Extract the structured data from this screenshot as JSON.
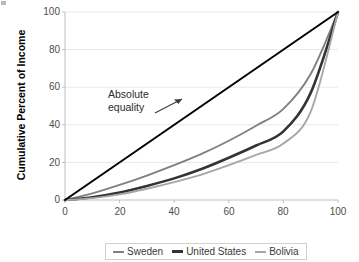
{
  "chart_data": {
    "type": "line",
    "title": "",
    "subtitle": "",
    "xlabel": "Percent of Households",
    "ylabel": "Cumulative Percent of Income",
    "xlim": [
      0,
      100
    ],
    "ylim": [
      0,
      100
    ],
    "xticks": [
      0,
      20,
      40,
      60,
      80,
      100
    ],
    "yticks": [
      0,
      20,
      40,
      60,
      80,
      100
    ],
    "grid": "horizontal",
    "legend_position": "bottom",
    "x": [
      0,
      10,
      20,
      30,
      40,
      50,
      60,
      70,
      80,
      90,
      100
    ],
    "series": [
      {
        "name": "Sweden",
        "color": "#808080",
        "values": [
          0,
          3.5,
          8,
          13,
          18.5,
          24.5,
          31.5,
          39.5,
          48.5,
          67,
          100
        ]
      },
      {
        "name": "United States",
        "color": "#333333",
        "values": [
          0,
          1.5,
          4,
          7.5,
          11.5,
          16.5,
          22.5,
          29,
          36.5,
          57,
          100
        ]
      },
      {
        "name": "Bolivia",
        "color": "#a6a6a6",
        "values": [
          0,
          1,
          3,
          6,
          9.5,
          13.5,
          18.5,
          24,
          30,
          47,
          100
        ]
      },
      {
        "name": "Absolute equality",
        "color": "#000000",
        "values": [
          0,
          10,
          20,
          30,
          40,
          50,
          60,
          70,
          80,
          90,
          100
        ]
      }
    ],
    "annotations": [
      {
        "text_line_1": "Absolute",
        "text_line_2": "equality",
        "arrow": "arrow-up-right",
        "points_to_series": "Absolute equality"
      }
    ]
  },
  "legend": {
    "entries": [
      {
        "label": "Sweden",
        "color": "#808080",
        "thickness": "2px"
      },
      {
        "label": "United States",
        "color": "#333333",
        "thickness": "3px"
      },
      {
        "label": "Bolivia",
        "color": "#a6a6a6",
        "thickness": "2px"
      }
    ]
  }
}
